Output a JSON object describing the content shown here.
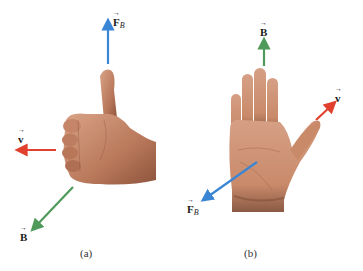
{
  "figure": {
    "panels": [
      {
        "id": "a",
        "caption": "(a)",
        "gesture": "thumbs-up fist",
        "vectors": [
          {
            "name": "force",
            "symbol": "F",
            "subscript": "B",
            "color": "#3a86d4",
            "direction": "up"
          },
          {
            "name": "velocity",
            "symbol": "v",
            "subscript": "",
            "color": "#e2402e",
            "direction": "left"
          },
          {
            "name": "magnetic-field",
            "symbol": "B",
            "subscript": "",
            "color": "#4f9a5a",
            "direction": "down-left"
          }
        ]
      },
      {
        "id": "b",
        "caption": "(b)",
        "gesture": "open palm",
        "vectors": [
          {
            "name": "magnetic-field",
            "symbol": "B",
            "subscript": "",
            "color": "#4f9a5a",
            "direction": "up"
          },
          {
            "name": "velocity",
            "symbol": "v",
            "subscript": "",
            "color": "#e2402e",
            "direction": "up-right"
          },
          {
            "name": "force",
            "symbol": "F",
            "subscript": "B",
            "color": "#3a86d4",
            "direction": "down-left"
          }
        ]
      }
    ]
  },
  "colors": {
    "skin": "#c98a6a",
    "skin_shadow": "#9a5f45",
    "skin_light": "#dca486"
  }
}
